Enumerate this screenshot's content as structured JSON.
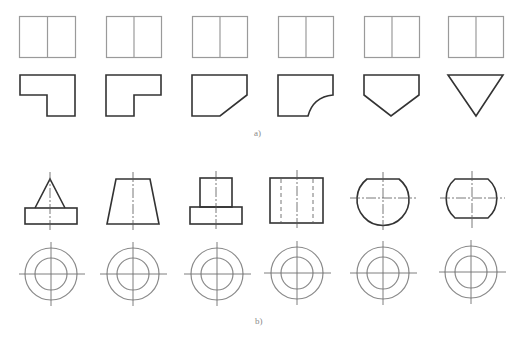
{
  "figure": {
    "part_a": {
      "label": "a)",
      "description": "Six top views (identical rectangles split vertically) with different front-view profiles",
      "profiles": [
        "L-shape notch lower-left",
        "L-shape notch lower-right",
        "chamfered lower-right corner",
        "concave arc lower-right corner",
        "pentagon pointed bottom",
        "inverted triangle"
      ]
    },
    "part_b": {
      "label": "b)",
      "description": "Six front views with concentric-circle top views",
      "profiles": [
        "cone on cylinder base",
        "truncated cone",
        "cylinder on cylinder base",
        "cylinder with hidden bore",
        "sphere with flat top",
        "sphere with flat top and bottom"
      ]
    },
    "colors": {
      "outline": "#333333",
      "thin_line": "#9a9a9a",
      "label": "#8a8a8a"
    }
  }
}
